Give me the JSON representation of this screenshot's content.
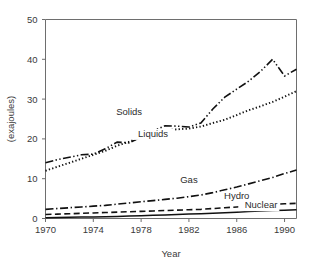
{
  "chart_data": {
    "type": "line",
    "title": "",
    "xlabel": "Year",
    "ylabel": "(exajoules)",
    "xlim": [
      1970,
      1991
    ],
    "ylim": [
      0,
      50
    ],
    "xticks": [
      1970,
      1974,
      1978,
      1982,
      1986,
      1990
    ],
    "yticks": [
      0,
      10,
      20,
      30,
      40,
      50
    ],
    "grid": false,
    "legend_position": "inline-labels",
    "x": [
      1970,
      1971,
      1972,
      1973,
      1974,
      1975,
      1976,
      1977,
      1978,
      1979,
      1980,
      1981,
      1982,
      1983,
      1984,
      1985,
      1986,
      1987,
      1988,
      1989,
      1990,
      1991
    ],
    "series": [
      {
        "name": "Solids",
        "linestyle": "dashdotdot",
        "label_x": 1977,
        "label_y": 26,
        "values": [
          14.0,
          14.8,
          15.4,
          16.0,
          16.2,
          17.5,
          19.2,
          19.0,
          20.5,
          22.0,
          23.3,
          23.2,
          23.0,
          24.0,
          27.5,
          30.5,
          32.5,
          34.5,
          37.0,
          40.0,
          35.8,
          37.5
        ]
      },
      {
        "name": "Liquids",
        "linestyle": "dotted",
        "label_x": 1979,
        "label_y": 20.5,
        "values": [
          12.0,
          13.0,
          14.0,
          15.0,
          16.0,
          17.0,
          18.3,
          19.3,
          20.5,
          21.6,
          22.2,
          22.4,
          22.6,
          23.1,
          24.0,
          24.8,
          26.0,
          27.2,
          28.2,
          29.3,
          30.6,
          32.0
        ]
      },
      {
        "name": "Gas",
        "linestyle": "dashdot",
        "label_x": 1982,
        "label_y": 9.0,
        "values": [
          2.3,
          2.5,
          2.7,
          2.9,
          3.1,
          3.3,
          3.6,
          3.9,
          4.2,
          4.5,
          4.8,
          5.1,
          5.5,
          5.9,
          6.5,
          7.2,
          7.9,
          8.7,
          9.5,
          10.3,
          11.3,
          12.2
        ]
      },
      {
        "name": "Hydro",
        "linestyle": "dashed",
        "label_x": 1986,
        "label_y": 4.8,
        "values": [
          1.0,
          1.1,
          1.2,
          1.3,
          1.4,
          1.5,
          1.6,
          1.7,
          1.8,
          1.9,
          2.0,
          2.1,
          2.2,
          2.3,
          2.5,
          2.7,
          2.9,
          3.1,
          3.3,
          3.5,
          3.7,
          3.8
        ]
      },
      {
        "name": "Nuclear",
        "linestyle": "solid",
        "label_x": 1989.4,
        "label_y": 2.6,
        "values": [
          0.2,
          0.25,
          0.3,
          0.35,
          0.4,
          0.45,
          0.5,
          0.6,
          0.7,
          0.8,
          0.9,
          1.0,
          1.1,
          1.2,
          1.3,
          1.45,
          1.6,
          1.75,
          1.9,
          2.0,
          2.1,
          2.2
        ]
      }
    ]
  },
  "colors": {
    "line": "#111111",
    "axis": "#6e6e6e",
    "text": "#3a3a3a",
    "background": "#ffffff"
  }
}
